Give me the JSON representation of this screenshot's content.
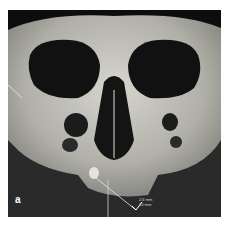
{
  "figure": {
    "panel_label": "a",
    "measurement": {
      "line1": "2.6 mm",
      "line2": "10 mm"
    },
    "colors": {
      "background": "#2a2a2a",
      "bone": "#c8c8c0",
      "measure_line": "#e0e0e0"
    }
  }
}
